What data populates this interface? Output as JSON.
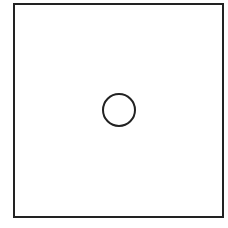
{
  "diagram": {
    "background": "#ffffff",
    "stroke_color": "#222222",
    "frame": {
      "x": 14,
      "y": 4,
      "width": 209,
      "height": 213,
      "stroke_width": 2
    },
    "circle": {
      "cx": 119,
      "cy": 110,
      "r": 16,
      "stroke_width": 2
    }
  }
}
